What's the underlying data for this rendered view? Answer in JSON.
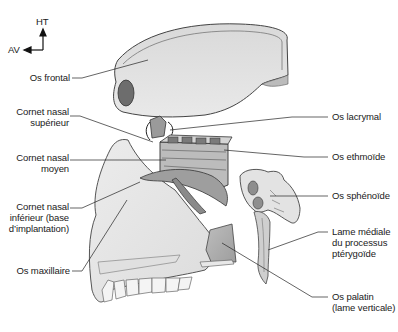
{
  "figure": {
    "orientation": {
      "up_label": "HT",
      "front_label": "AV"
    },
    "labels_left": [
      {
        "id": "frontal",
        "text": "Os frontal"
      },
      {
        "id": "cornet-sup",
        "text": "Cornet nasal\nsupérieur"
      },
      {
        "id": "cornet-moyen",
        "text": "Cornet nasal\nmoyen"
      },
      {
        "id": "cornet-inf",
        "text": "Cornet nasal\ninférieur (base\nd’implantation)"
      },
      {
        "id": "maxillaire",
        "text": "Os maxillaire"
      }
    ],
    "labels_right": [
      {
        "id": "lacrymal",
        "text": "Os lacrymal"
      },
      {
        "id": "ethmoide",
        "text": "Os ethmoïde"
      },
      {
        "id": "sphenoide",
        "text": "Os sphénoïde"
      },
      {
        "id": "pterygoide",
        "text": "Lame médiale\ndu processus\nptérygoïde"
      },
      {
        "id": "palatin",
        "text": "Os palatin\n(lame verticale)"
      }
    ],
    "colors": {
      "ink": "#1a1a1a",
      "bone_light": "#e6e6e6",
      "bone_mid": "#c8c8c8",
      "bone_dark": "#8a8a8a",
      "background": "#ffffff"
    }
  }
}
